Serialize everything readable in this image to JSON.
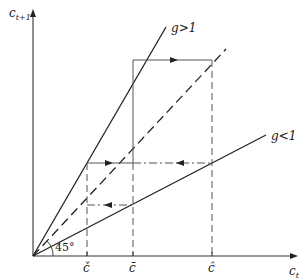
{
  "diagram": {
    "type": "phase diagram",
    "axes": {
      "y_label": "c",
      "y_subscript": "t+1",
      "x_label": "c",
      "x_subscript": "t"
    },
    "lines": [
      {
        "id": "g_greater_1",
        "label": "g>1",
        "style": "solid"
      },
      {
        "id": "forty_five",
        "label": "",
        "style": "dashed"
      },
      {
        "id": "g_less_1",
        "label": "g<1",
        "style": "solid"
      }
    ],
    "angle_label": "45°",
    "ticks": [
      {
        "id": "c_check",
        "label": "č"
      },
      {
        "id": "c_bar",
        "label": "c̄"
      },
      {
        "id": "c_hat",
        "label": "ĉ"
      }
    ]
  }
}
